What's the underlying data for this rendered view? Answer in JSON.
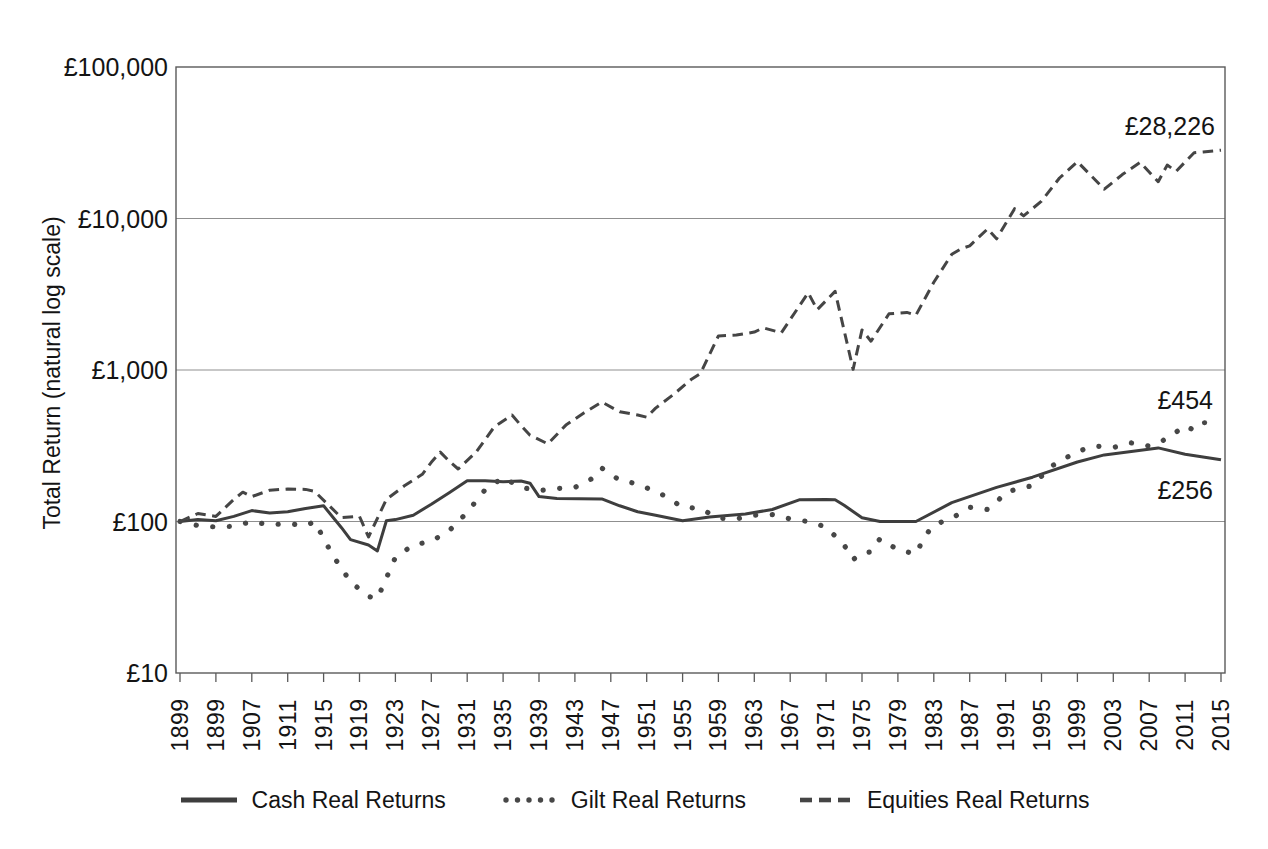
{
  "chart_data": {
    "type": "line",
    "title": "",
    "ylabel": "Total Return (natural log scale)",
    "xlabel": "",
    "y_scale": "log10",
    "ylim": [
      10,
      100000
    ],
    "xlim": [
      1899,
      2015
    ],
    "grid": "horizontal",
    "legend_position": "bottom",
    "colors": {
      "series_stroke": "#3e3e3e",
      "grid": "#8f8f8f",
      "border": "#5a5a5a",
      "text": "#141414",
      "background": "#ffffff"
    },
    "y_ticks": [
      {
        "value": 100000,
        "label": "£100,000"
      },
      {
        "value": 10000,
        "label": "£10,000"
      },
      {
        "value": 1000,
        "label": "£1,000"
      },
      {
        "value": 100,
        "label": "£100"
      },
      {
        "value": 10,
        "label": "£10"
      }
    ],
    "x_ticks": [
      {
        "year": 1899,
        "label": "1899"
      },
      {
        "year": 1903,
        "label": "1899"
      },
      {
        "year": 1907,
        "label": "1907"
      },
      {
        "year": 1911,
        "label": "1911"
      },
      {
        "year": 1915,
        "label": "1915"
      },
      {
        "year": 1919,
        "label": "1919"
      },
      {
        "year": 1923,
        "label": "1923"
      },
      {
        "year": 1927,
        "label": "1927"
      },
      {
        "year": 1931,
        "label": "1931"
      },
      {
        "year": 1935,
        "label": "1935"
      },
      {
        "year": 1939,
        "label": "1939"
      },
      {
        "year": 1943,
        "label": "1943"
      },
      {
        "year": 1947,
        "label": "1947"
      },
      {
        "year": 1951,
        "label": "1951"
      },
      {
        "year": 1955,
        "label": "1955"
      },
      {
        "year": 1959,
        "label": "1959"
      },
      {
        "year": 1963,
        "label": "1963"
      },
      {
        "year": 1967,
        "label": "1967"
      },
      {
        "year": 1971,
        "label": "1971"
      },
      {
        "year": 1975,
        "label": "1975"
      },
      {
        "year": 1979,
        "label": "1979"
      },
      {
        "year": 1983,
        "label": "1983"
      },
      {
        "year": 1987,
        "label": "1987"
      },
      {
        "year": 1991,
        "label": "1991"
      },
      {
        "year": 1995,
        "label": "1995"
      },
      {
        "year": 1999,
        "label": "1999"
      },
      {
        "year": 2003,
        "label": "2003"
      },
      {
        "year": 2007,
        "label": "2007"
      },
      {
        "year": 2011,
        "label": "2011"
      },
      {
        "year": 2015,
        "label": "2015"
      }
    ],
    "annotations": [
      {
        "series": "Equities Real Returns",
        "text": "£28,226"
      },
      {
        "series": "Gilt Real Returns",
        "text": "£454"
      },
      {
        "series": "Cash Real Returns",
        "text": "£256"
      }
    ],
    "legend": [
      {
        "label": "Cash Real Returns",
        "style": "solid"
      },
      {
        "label": "Gilt Real Returns",
        "style": "dotted"
      },
      {
        "label": "Equities Real Returns",
        "style": "dashed"
      }
    ],
    "series": [
      {
        "name": "Cash Real Returns",
        "style": "solid",
        "end_value": 256,
        "points": [
          [
            1899,
            100
          ],
          [
            1901,
            103
          ],
          [
            1903,
            101
          ],
          [
            1905,
            108
          ],
          [
            1907,
            118
          ],
          [
            1909,
            114
          ],
          [
            1911,
            116
          ],
          [
            1913,
            122
          ],
          [
            1915,
            127
          ],
          [
            1917,
            91
          ],
          [
            1918,
            76
          ],
          [
            1920,
            70
          ],
          [
            1921,
            64
          ],
          [
            1922,
            101
          ],
          [
            1923,
            103
          ],
          [
            1925,
            110
          ],
          [
            1927,
            130
          ],
          [
            1929,
            155
          ],
          [
            1931,
            186
          ],
          [
            1933,
            186
          ],
          [
            1935,
            183
          ],
          [
            1937,
            185
          ],
          [
            1938,
            179
          ],
          [
            1939,
            146
          ],
          [
            1941,
            142
          ],
          [
            1946,
            141
          ],
          [
            1948,
            127
          ],
          [
            1950,
            116
          ],
          [
            1952,
            110
          ],
          [
            1955,
            101
          ],
          [
            1958,
            107
          ],
          [
            1962,
            112
          ],
          [
            1965,
            120
          ],
          [
            1968,
            139
          ],
          [
            1971,
            140
          ],
          [
            1972,
            139
          ],
          [
            1973,
            128
          ],
          [
            1975,
            106
          ],
          [
            1977,
            100
          ],
          [
            1981,
            100
          ],
          [
            1985,
            133
          ],
          [
            1990,
            168
          ],
          [
            1994,
            196
          ],
          [
            1999,
            247
          ],
          [
            2002,
            275
          ],
          [
            2008,
            306
          ],
          [
            2011,
            278
          ],
          [
            2015,
            256
          ]
        ]
      },
      {
        "name": "Gilt Real Returns",
        "style": "dotted",
        "end_value": 454,
        "points": [
          [
            1899,
            100
          ],
          [
            1901,
            94
          ],
          [
            1903,
            92
          ],
          [
            1905,
            93
          ],
          [
            1907,
            100
          ],
          [
            1909,
            95
          ],
          [
            1911,
            97
          ],
          [
            1913,
            94
          ],
          [
            1914,
            100
          ],
          [
            1916,
            60
          ],
          [
            1918,
            40
          ],
          [
            1920,
            32
          ],
          [
            1921,
            31
          ],
          [
            1923,
            58
          ],
          [
            1925,
            70
          ],
          [
            1927,
            74
          ],
          [
            1929,
            87
          ],
          [
            1931,
            115
          ],
          [
            1933,
            162
          ],
          [
            1935,
            195
          ],
          [
            1937,
            168
          ],
          [
            1939,
            160
          ],
          [
            1941,
            165
          ],
          [
            1943,
            168
          ],
          [
            1945,
            193
          ],
          [
            1946,
            225
          ],
          [
            1948,
            187
          ],
          [
            1950,
            177
          ],
          [
            1953,
            148
          ],
          [
            1955,
            124
          ],
          [
            1957,
            122
          ],
          [
            1959,
            105
          ],
          [
            1961,
            104
          ],
          [
            1963,
            110
          ],
          [
            1965,
            111
          ],
          [
            1967,
            104
          ],
          [
            1969,
            100
          ],
          [
            1971,
            92
          ],
          [
            1973,
            70
          ],
          [
            1974,
            56
          ],
          [
            1975,
            62
          ],
          [
            1976,
            63
          ],
          [
            1977,
            77
          ],
          [
            1979,
            65
          ],
          [
            1981,
            61
          ],
          [
            1982,
            80
          ],
          [
            1983,
            95
          ],
          [
            1985,
            105
          ],
          [
            1987,
            124
          ],
          [
            1989,
            120
          ],
          [
            1990,
            134
          ],
          [
            1991,
            156
          ],
          [
            1993,
            168
          ],
          [
            1994,
            172
          ],
          [
            1996,
            230
          ],
          [
            1997,
            248
          ],
          [
            1999,
            290
          ],
          [
            2001,
            315
          ],
          [
            2003,
            308
          ],
          [
            2005,
            330
          ],
          [
            2007,
            315
          ],
          [
            2009,
            352
          ],
          [
            2011,
            430
          ],
          [
            2012,
            400
          ],
          [
            2013,
            448
          ],
          [
            2015,
            454
          ]
        ]
      },
      {
        "name": "Equities Real Returns",
        "style": "dashed",
        "end_value": 28226,
        "points": [
          [
            1899,
            100
          ],
          [
            1901,
            113
          ],
          [
            1903,
            108
          ],
          [
            1905,
            140
          ],
          [
            1906,
            156
          ],
          [
            1907,
            146
          ],
          [
            1909,
            161
          ],
          [
            1911,
            164
          ],
          [
            1913,
            163
          ],
          [
            1914,
            158
          ],
          [
            1917,
            106
          ],
          [
            1919,
            108
          ],
          [
            1920,
            79
          ],
          [
            1922,
            140
          ],
          [
            1924,
            172
          ],
          [
            1926,
            205
          ],
          [
            1927,
            246
          ],
          [
            1928,
            287
          ],
          [
            1929,
            250
          ],
          [
            1930,
            222
          ],
          [
            1932,
            287
          ],
          [
            1934,
            420
          ],
          [
            1936,
            505
          ],
          [
            1937,
            430
          ],
          [
            1938,
            371
          ],
          [
            1940,
            325
          ],
          [
            1942,
            433
          ],
          [
            1944,
            520
          ],
          [
            1946,
            615
          ],
          [
            1948,
            530
          ],
          [
            1950,
            505
          ],
          [
            1951,
            488
          ],
          [
            1952,
            560
          ],
          [
            1954,
            690
          ],
          [
            1956,
            870
          ],
          [
            1957,
            950
          ],
          [
            1959,
            1680
          ],
          [
            1961,
            1700
          ],
          [
            1963,
            1780
          ],
          [
            1964,
            1900
          ],
          [
            1966,
            1760
          ],
          [
            1969,
            3240
          ],
          [
            1970,
            2500
          ],
          [
            1972,
            3300
          ],
          [
            1974,
            1010
          ],
          [
            1975,
            1840
          ],
          [
            1976,
            1550
          ],
          [
            1978,
            2350
          ],
          [
            1980,
            2400
          ],
          [
            1981,
            2300
          ],
          [
            1983,
            3800
          ],
          [
            1985,
            5800
          ],
          [
            1986,
            6300
          ],
          [
            1987,
            6600
          ],
          [
            1989,
            8550
          ],
          [
            1990,
            7350
          ],
          [
            1992,
            11600
          ],
          [
            1993,
            10400
          ],
          [
            1995,
            13000
          ],
          [
            1997,
            18500
          ],
          [
            1999,
            23700
          ],
          [
            2002,
            15600
          ],
          [
            2004,
            19500
          ],
          [
            2006,
            23500
          ],
          [
            2008,
            17500
          ],
          [
            2009,
            22500
          ],
          [
            2010,
            20500
          ],
          [
            2012,
            27200
          ],
          [
            2013,
            27500
          ],
          [
            2015,
            28226
          ]
        ]
      }
    ]
  }
}
